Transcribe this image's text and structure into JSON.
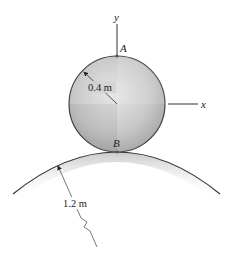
{
  "figure": {
    "labels": {
      "y_axis": "y",
      "x_axis": "x",
      "point_top": "A",
      "point_contact": "B",
      "disk_radius": "0.4 m",
      "surface_radius": "1.2 m"
    },
    "colors": {
      "line": "#333333",
      "disk_fill_light": "#e4e4e4",
      "disk_fill_dark": "#a9a9a9",
      "surface_shade": "#bdbdbd",
      "background": "#ffffff"
    }
  }
}
